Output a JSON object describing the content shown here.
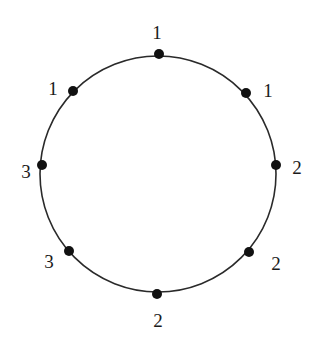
{
  "diagram": {
    "type": "cycle-graph",
    "colors": {
      "background": "#ffffff",
      "stroke": "#2a2a2a",
      "node": "#111111",
      "label": "#1a1a1a"
    },
    "circle": {
      "cx": 158,
      "cy": 174,
      "r": 118
    },
    "nodes": [
      {
        "id": "top",
        "x": 159,
        "y": 54,
        "label": "1",
        "lx": 157,
        "ly": 39
      },
      {
        "id": "upper-right",
        "x": 246,
        "y": 93,
        "label": "1",
        "lx": 268,
        "ly": 97
      },
      {
        "id": "right",
        "x": 276,
        "y": 165,
        "label": "2",
        "lx": 297,
        "ly": 174
      },
      {
        "id": "lower-right",
        "x": 249,
        "y": 252,
        "label": "2",
        "lx": 276,
        "ly": 270
      },
      {
        "id": "bottom",
        "x": 157,
        "y": 294,
        "label": "2",
        "lx": 158,
        "ly": 327
      },
      {
        "id": "lower-left",
        "x": 69,
        "y": 251,
        "label": "3",
        "lx": 49,
        "ly": 268
      },
      {
        "id": "left",
        "x": 42,
        "y": 165,
        "label": "3",
        "lx": 26,
        "ly": 178
      },
      {
        "id": "upper-left",
        "x": 73,
        "y": 91,
        "label": "1",
        "lx": 53,
        "ly": 95
      }
    ]
  }
}
